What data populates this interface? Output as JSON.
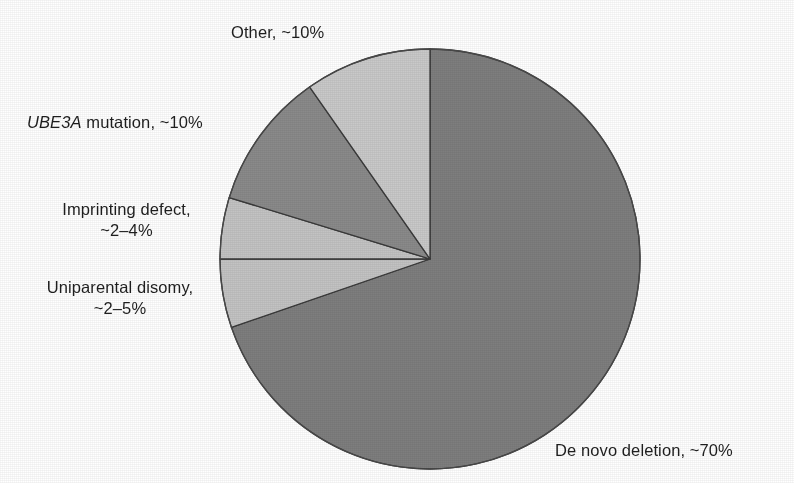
{
  "figure": {
    "background_color": "#ffffff",
    "title_fragment": "",
    "text_color": "#1f1f1f"
  },
  "chart_data": {
    "type": "pie",
    "title": "",
    "subtitle": "",
    "xlabel": "",
    "ylabel": "",
    "grid": false,
    "legend_position": "none",
    "label_style": "outside callout text",
    "start_angle_deg": 0,
    "direction": "clockwise",
    "center": {
      "x": 430,
      "y": 259,
      "radius": 210
    },
    "categories": [
      "De novo deletion",
      "Uniparental disomy",
      "Imprinting defect",
      "UBE3A mutation",
      "Other"
    ],
    "values": [
      70,
      5,
      4,
      10,
      10
    ],
    "value_labels": [
      "~70%",
      "~2–5%",
      "~2–4%",
      "~10%",
      "~10%"
    ],
    "slices": [
      {
        "name": "De novo deletion",
        "label": "De novo deletion, ~70%",
        "value_text": "~70%",
        "value": 70,
        "start_deg": 0,
        "end_deg": 251,
        "color": "#7e7e7e",
        "stroke": "#3a3a3a",
        "italic_prefix": ""
      },
      {
        "name": "Uniparental disomy",
        "label": "Uniparental disomy, ~2–5%",
        "label_line1": "Uniparental disomy,",
        "label_line2": "~2–5%",
        "value_text": "~2–5%",
        "value": 5,
        "start_deg": 251,
        "end_deg": 270,
        "color": "#c3c3c3",
        "stroke": "#3a3a3a",
        "italic_prefix": ""
      },
      {
        "name": "Imprinting defect",
        "label": "Imprinting defect, ~2–4%",
        "label_line1": "Imprinting defect,",
        "label_line2": "~2–4%",
        "value_text": "~2–4%",
        "value": 4,
        "start_deg": 270,
        "end_deg": 287,
        "color": "#c3c3c3",
        "stroke": "#3a3a3a",
        "italic_prefix": ""
      },
      {
        "name": "UBE3A mutation",
        "label": "UBE3A mutation, ~10%",
        "value_text": "~10%",
        "value": 10,
        "start_deg": 287,
        "end_deg": 325,
        "color": "#8a8a8a",
        "stroke": "#3a3a3a",
        "italic_prefix": "UBE3A"
      },
      {
        "name": "Other",
        "label": "Other, ~10%",
        "value_text": "~10%",
        "value": 10,
        "start_deg": 325,
        "end_deg": 360,
        "color": "#c9c9c9",
        "stroke": "#3a3a3a",
        "italic_prefix": ""
      }
    ]
  },
  "labels": {
    "other": "Other, ~10%",
    "ube3a_italic": "UBE3A",
    "ube3a_rest": " mutation, ~10%",
    "imprinting_line1": "Imprinting defect,",
    "imprinting_line2": "~2–4%",
    "upd_line1": "Uniparental disomy,",
    "upd_line2": "~2–5%",
    "de_novo": "De novo deletion, ~70%"
  }
}
